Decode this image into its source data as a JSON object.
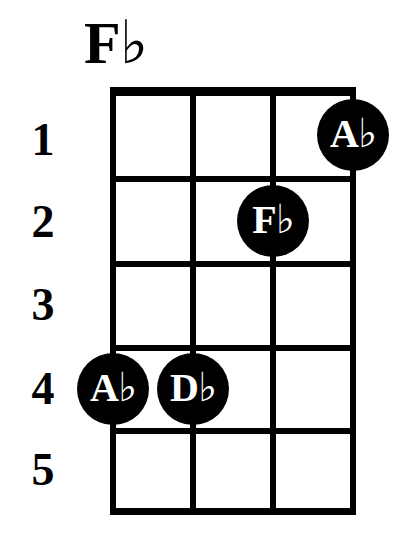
{
  "chord": {
    "name": "F♭",
    "instrument_strings": 4,
    "frets_shown": 5
  },
  "fret_numbers": [
    "1",
    "2",
    "3",
    "4",
    "5"
  ],
  "fingerings": [
    {
      "label": "A♭",
      "string": 4,
      "fret": 1
    },
    {
      "label": "F♭",
      "string": 3,
      "fret": 2
    },
    {
      "label": "A♭",
      "string": 1,
      "fret": 4
    },
    {
      "label": "D♭",
      "string": 2,
      "fret": 4
    }
  ],
  "colors": {
    "ink": "#000000",
    "paper": "#ffffff",
    "dot_text": "#ffffff"
  },
  "geometry": {
    "grid_left": 113,
    "grid_right": 353,
    "nut_y": 91,
    "bottom_y": 511,
    "string_x": [
      113,
      193,
      273,
      353
    ],
    "fret_y": [
      91,
      178,
      263,
      347,
      430,
      511
    ],
    "fret_label_y": [
      140,
      222,
      305,
      389,
      470
    ],
    "dot_radius": 36
  }
}
